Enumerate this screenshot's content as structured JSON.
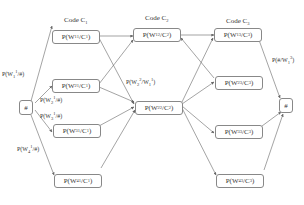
{
  "columns": [
    {
      "title": "Code C",
      "sub": "1"
    },
    {
      "title": "Code C",
      "sub": "2"
    },
    {
      "title": "Code C",
      "sub": "3"
    }
  ],
  "start_node": {
    "label": "#"
  },
  "end_node": {
    "label": "#"
  },
  "nodes": {
    "c1": [
      {
        "pre": "P(W",
        "sub": "1",
        "sup": "1",
        "mid": "/C",
        "csub": "1",
        "post": ")"
      },
      {
        "pre": "P(W",
        "sub": "2",
        "sup": "1",
        "mid": "/C",
        "csub": "1",
        "post": ")"
      },
      {
        "pre": "P(W",
        "sub": "3",
        "sup": "1",
        "mid": "/C",
        "csub": "1",
        "post": ")"
      },
      {
        "pre": "P(W",
        "sub": "4",
        "sup": "1",
        "mid": "/C",
        "csub": "1",
        "post": ")"
      }
    ],
    "c2": [
      {
        "pre": "P(W",
        "sub": "1",
        "sup": "2",
        "mid": "/C",
        "csub": "2",
        "post": ")"
      },
      {
        "pre": "P(W",
        "sub": "2",
        "sup": "2",
        "mid": "/C",
        "csub": "2",
        "post": ")"
      }
    ],
    "c3": [
      {
        "pre": "P(W",
        "sub": "1",
        "sup": "3",
        "mid": "/C",
        "csub": "3",
        "post": ")"
      },
      {
        "pre": "P(W",
        "sub": "2",
        "sup": "3",
        "mid": "/C",
        "csub": "3",
        "post": ")"
      },
      {
        "pre": "P(W",
        "sub": "3",
        "sup": "3",
        "mid": "/C",
        "csub": "3",
        "post": ")"
      },
      {
        "pre": "P(W",
        "sub": "4",
        "sup": "3",
        "mid": "/C",
        "csub": "3",
        "post": ")"
      }
    ]
  },
  "edge_labels": {
    "start_w1": {
      "pre": "P(W",
      "sub": "1",
      "sup": "1",
      "post": "/#)"
    },
    "start_w2": {
      "pre": "P(W",
      "sub": "2",
      "sup": "1",
      "post": "/#)"
    },
    "start_w3": {
      "pre": "P(W",
      "sub": "3",
      "sup": "1",
      "post": "/#)"
    },
    "start_w4": {
      "pre": "P(W",
      "sub": "4",
      "sup": "1",
      "post": "/#)"
    },
    "trans_c1_c2": {
      "pre": "P(W",
      "sub": "2",
      "sup": "2",
      "mid": "/W",
      "sub2": "1",
      "sup2": "1",
      "post": ")"
    },
    "end": {
      "pre": "P(#/W",
      "sub": "1",
      "sup": "3",
      "post": ")"
    }
  },
  "colors": {
    "line": "#666666",
    "border": "#888888",
    "text": "#333333",
    "background": "#ffffff"
  }
}
